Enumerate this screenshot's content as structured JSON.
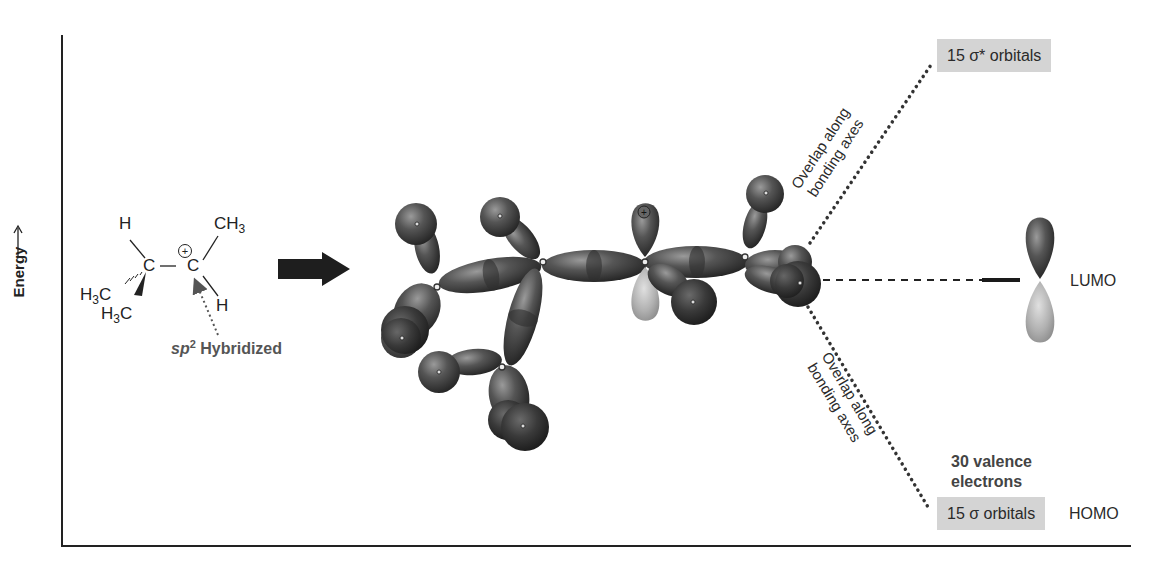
{
  "diagram": {
    "type": "molecular-orbital-energy-diagram",
    "y_axis_label": "Energy",
    "molecule": {
      "atoms": {
        "h_top": "H",
        "ch3_top": "CH",
        "ch3_top_sub": "3",
        "c_left": "C",
        "c_right": "C",
        "charge": "+",
        "h3c_wedge_left": "H",
        "h3c_wedge_left_sub": "3",
        "h3c_wedge_left_c": "C",
        "h3c_wedge_bottom": "H",
        "h3c_wedge_bottom_sub": "3",
        "h3c_wedge_bottom_c": "C",
        "h_bottom": "H"
      },
      "annotation_sp2": "sp",
      "annotation_sp2_sup": "2",
      "annotation_hybridized": " Hybridized"
    },
    "arrow": "reaction-arrow-right",
    "orbital_model": {
      "description": "3D sigma orbital model of sec-butyl cation with empty p orbital on cationic carbon",
      "charge_symbol": "+"
    },
    "labels": {
      "sigma_star": "15 σ* orbitals",
      "sigma": "15 σ orbitals",
      "homo": "HOMO",
      "lumo": "LUMO",
      "valence_line1": "30 valence",
      "valence_line2": "electrons",
      "overlap_upper_line1": "Overlap along",
      "overlap_upper_line2": "bonding axes",
      "overlap_lower_line1": "Overlap along",
      "overlap_lower_line2": "bonding axes"
    },
    "colors": {
      "axis": "#222222",
      "lobe_dark": "#3c3c3c",
      "lobe_light": "#a8a8a8",
      "label_box": "#d4d4d4",
      "text": "#2a2a2a"
    }
  }
}
